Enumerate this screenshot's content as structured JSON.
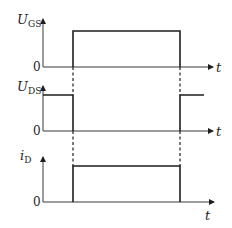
{
  "diagram": {
    "type": "timing-waveforms",
    "panels": [
      {
        "id": "ugs",
        "label_main": "U",
        "label_sub": "GS",
        "zero_label": "0",
        "time_label": "t",
        "waveform": "pulse-high between t1 and t2"
      },
      {
        "id": "uds",
        "label_main": "U",
        "label_sub": "DS",
        "zero_label": "0",
        "time_label": "t",
        "waveform": "high before t1, zero between t1 and t2, high after t2"
      },
      {
        "id": "id",
        "label_main": "i",
        "label_sub": "D",
        "zero_label": "0",
        "time_label": "t",
        "waveform": "pulse-high between t1 and t2"
      }
    ],
    "transition_markers": [
      "t1",
      "t2"
    ],
    "colors": {
      "line": "#1e1e1e",
      "axis": "#3a3a3a",
      "background": "#ffffff"
    }
  }
}
